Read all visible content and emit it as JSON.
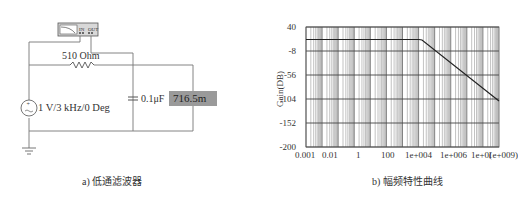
{
  "left_panel": {
    "caption": "a) 低通滤波器",
    "oscilloscope_label": "Bode Plotter",
    "resistor_label": "510 Ohm",
    "source_label": "1 V/3 kHz/0  Deg",
    "capacitor_label": "0.1μF",
    "meter_value": "716.5m",
    "icons": [
      "bode-plotter-icon",
      "resistor-icon",
      "ac-source-icon",
      "capacitor-icon",
      "ground-icon"
    ]
  },
  "right_panel": {
    "caption": "b) 幅频特性曲线"
  },
  "chart_data": {
    "type": "line",
    "title": "",
    "xlabel": "",
    "ylabel": "Gain(DB)",
    "x_scale": "log",
    "x_tick_labels": [
      "0.001",
      "0.01",
      "1",
      "100",
      "1e+004",
      "1e+006",
      "1e+0(",
      "1e+009)"
    ],
    "y_tick_labels": [
      "40",
      "-8",
      "-56",
      "-104",
      "-152",
      "-200"
    ],
    "ylim": [
      -200,
      40
    ],
    "xlim": [
      0.001,
      1000000000.0
    ],
    "grid": true,
    "series": [
      {
        "name": "Gain",
        "x": [
          0.001,
          0.1,
          10,
          1000,
          3000,
          100000.0,
          10000000.0,
          1000000000.0
        ],
        "y": [
          -2.9,
          -2.9,
          -2.9,
          -2.9,
          -3.3,
          -34,
          -74,
          -112
        ]
      }
    ]
  }
}
